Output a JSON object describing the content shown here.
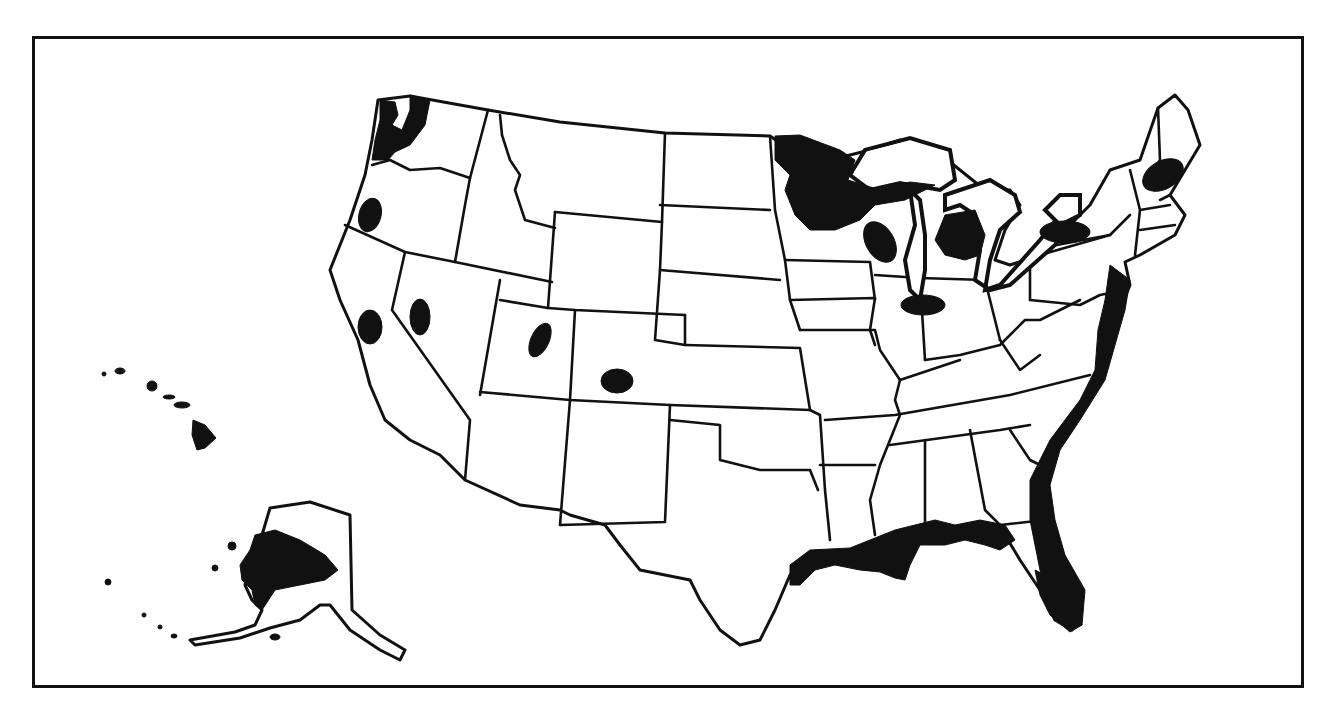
{
  "map": {
    "title": "",
    "description": "Outline map of the United States including Alaska and Hawaii, with shaded (black) regions",
    "colors": {
      "background": "#ffffff",
      "outline": "#111111",
      "shaded": "#111111"
    },
    "frame": {
      "x": 32,
      "y": 36,
      "width": 1272,
      "height": 652
    },
    "shaded_regions": [
      {
        "name": "Puget Sound / Olympic Peninsula (WA)"
      },
      {
        "name": "Central Oregon"
      },
      {
        "name": "Central California"
      },
      {
        "name": "Western Nevada"
      },
      {
        "name": "Central Utah"
      },
      {
        "name": "Central Colorado"
      },
      {
        "name": "Northern Minnesota / Upper Michigan / Northern Wisconsin"
      },
      {
        "name": "Central Wisconsin"
      },
      {
        "name": "Lower Michigan"
      },
      {
        "name": "Northern Illinois / Indiana"
      },
      {
        "name": "Lake Ontario shore (NY)"
      },
      {
        "name": "New Hampshire / Maine"
      },
      {
        "name": "Atlantic coastal plain (NJ to Florida)"
      },
      {
        "name": "Gulf coast (TX, LA, MS, AL, FL panhandle)"
      },
      {
        "name": "Peninsular Florida"
      },
      {
        "name": "Western Alaska"
      },
      {
        "name": "Hawaiian Islands"
      }
    ]
  }
}
